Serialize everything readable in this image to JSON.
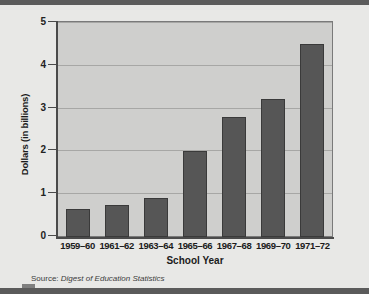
{
  "chart_data": {
    "type": "bar",
    "title": "",
    "xlabel": "School Year",
    "ylabel": "Dollars (in billions)",
    "categories": [
      "1959–60",
      "1961–62",
      "1963–64",
      "1965–66",
      "1967–68",
      "1969–70",
      "1971–72"
    ],
    "values": [
      0.65,
      0.75,
      0.9,
      2.0,
      2.8,
      3.2,
      4.5
    ],
    "ylim": [
      0,
      5
    ],
    "yticks": [
      0,
      1,
      2,
      3,
      4,
      5
    ],
    "ytick_labels": [
      "0",
      "1",
      "2",
      "3",
      "4",
      "5"
    ],
    "grid": true,
    "grid_axis": "y",
    "legend": false,
    "bar_color": "#565656",
    "plot_background": "#cfcfcd",
    "page_background": "#e8e8e6",
    "axis_color": "#4a4a4a",
    "gridline_color": "#a7a7a5"
  },
  "source": {
    "prefix": "Source:",
    "publication": "Digest of Education Statistics"
  }
}
